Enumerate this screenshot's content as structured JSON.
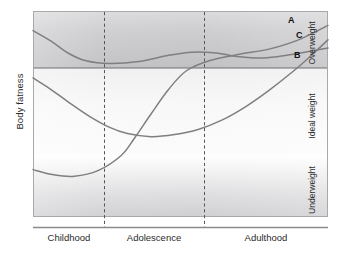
{
  "chart_data": {
    "type": "line",
    "title": "",
    "ylabel": "Body fatness",
    "xlabel": "",
    "grid": false,
    "legend_position": "inline-right",
    "x_categories": [
      "Childhood",
      "Adolescence",
      "Adulthood"
    ],
    "x_divider_labels": [
      "Childhood",
      "Adolescence",
      "Adulthood"
    ],
    "y_bands": [
      {
        "name": "Overweight",
        "from": 0.695,
        "to": 1.0
      },
      {
        "name": "Ideal weight",
        "from": 0.28,
        "to": 0.695
      },
      {
        "name": "Underweight",
        "from": 0.0,
        "to": 0.28
      }
    ],
    "series": [
      {
        "name": "A",
        "label": "A",
        "description": "Starts underweight in childhood, dips slightly, then rises steeply through adolescence into overweight by adulthood",
        "points": [
          {
            "x": 0.0,
            "y": 0.23
          },
          {
            "x": 0.07,
            "y": 0.205
          },
          {
            "x": 0.14,
            "y": 0.198
          },
          {
            "x": 0.22,
            "y": 0.225
          },
          {
            "x": 0.3,
            "y": 0.3
          },
          {
            "x": 0.345,
            "y": 0.385
          },
          {
            "x": 0.4,
            "y": 0.5
          },
          {
            "x": 0.46,
            "y": 0.62
          },
          {
            "x": 0.52,
            "y": 0.71
          },
          {
            "x": 0.6,
            "y": 0.76
          },
          {
            "x": 0.7,
            "y": 0.79
          },
          {
            "x": 0.8,
            "y": 0.815
          },
          {
            "x": 0.9,
            "y": 0.86
          },
          {
            "x": 1.0,
            "y": 0.93
          }
        ]
      },
      {
        "name": "B",
        "label": "B",
        "description": "Begins overweight in early childhood, falls to a low plateau, then slowly rises and stays in the overweight band",
        "points": [
          {
            "x": 0.0,
            "y": 0.905
          },
          {
            "x": 0.06,
            "y": 0.855
          },
          {
            "x": 0.12,
            "y": 0.795
          },
          {
            "x": 0.18,
            "y": 0.758
          },
          {
            "x": 0.26,
            "y": 0.745
          },
          {
            "x": 0.36,
            "y": 0.755
          },
          {
            "x": 0.46,
            "y": 0.785
          },
          {
            "x": 0.54,
            "y": 0.8
          },
          {
            "x": 0.62,
            "y": 0.796
          },
          {
            "x": 0.7,
            "y": 0.778
          },
          {
            "x": 0.78,
            "y": 0.772
          },
          {
            "x": 0.86,
            "y": 0.785
          },
          {
            "x": 0.94,
            "y": 0.805
          },
          {
            "x": 1.0,
            "y": 0.82
          }
        ]
      },
      {
        "name": "C",
        "label": "C",
        "description": "Starts high in childhood, declines sharply to ideal weight, flattens, then climbs steadily into overweight in adulthood",
        "points": [
          {
            "x": 0.0,
            "y": 0.675
          },
          {
            "x": 0.06,
            "y": 0.62
          },
          {
            "x": 0.12,
            "y": 0.558
          },
          {
            "x": 0.19,
            "y": 0.49
          },
          {
            "x": 0.26,
            "y": 0.435
          },
          {
            "x": 0.32,
            "y": 0.405
          },
          {
            "x": 0.4,
            "y": 0.39
          },
          {
            "x": 0.48,
            "y": 0.4
          },
          {
            "x": 0.56,
            "y": 0.425
          },
          {
            "x": 0.64,
            "y": 0.47
          },
          {
            "x": 0.72,
            "y": 0.535
          },
          {
            "x": 0.8,
            "y": 0.615
          },
          {
            "x": 0.88,
            "y": 0.705
          },
          {
            "x": 0.94,
            "y": 0.78
          },
          {
            "x": 1.0,
            "y": 0.86
          }
        ]
      }
    ],
    "dividers": [
      0.345,
      0.685
    ],
    "colors": {
      "curve": "#7f7f82",
      "axis": "#8a8a8c",
      "frame": "#6e6e70",
      "divider": "#55565a",
      "text": "#231f20",
      "overweight_band": "#c9c9cb",
      "ideal_band": "#f0f0f1",
      "underweight_band": "#d6d6d8"
    }
  },
  "labels": {
    "y_axis": "Body fatness",
    "x_ticks": [
      "Childhood",
      "Adolescence",
      "Adulthood"
    ],
    "zones": [
      "Overweight",
      "Ideal weight",
      "Underweight"
    ],
    "curves": [
      "A",
      "C",
      "B"
    ]
  }
}
